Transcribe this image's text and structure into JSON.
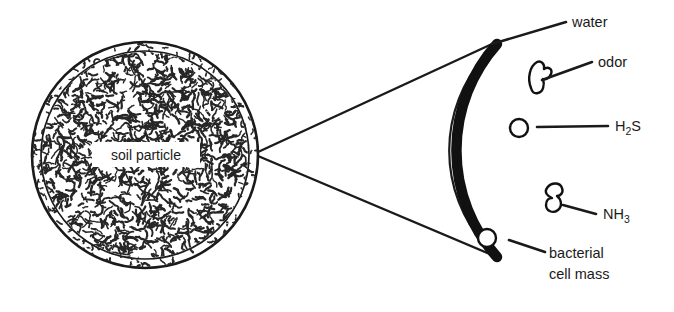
{
  "figure": {
    "background_color": "#ffffff",
    "ink_color": "#1a1a1a"
  },
  "particle": {
    "label": "soil particle",
    "shape": "circle",
    "center_x": 145,
    "center_y": 155,
    "radius": 113,
    "outer_ring_color": "#1a1a1a",
    "fill_texture": "squiggle-hatch",
    "texture_color": "#262626"
  },
  "detail": {
    "description": "magnified crescent wedge of the particle edge",
    "inner_arc_color": "#1a1a1a",
    "texture_band_color": "#262626",
    "cell_mass_band_color": "#111111"
  },
  "callouts": [
    {
      "id": "water",
      "label": "water",
      "label_x": 572,
      "label_y": 27,
      "leader_from_x": 492,
      "leader_from_y": 44,
      "leader_to_x": 566,
      "leader_to_y": 22
    },
    {
      "id": "odor",
      "label": "odor",
      "label_x": 598,
      "label_y": 67,
      "leader_from_x": 542,
      "leader_from_y": 80,
      "leader_to_x": 592,
      "leader_to_y": 62
    },
    {
      "id": "h2s",
      "label": "H",
      "label_sub": "2",
      "label_tail": "S",
      "label_x": 615,
      "label_y": 131,
      "leader_from_x": 537,
      "leader_from_y": 127,
      "leader_to_x": 608,
      "leader_to_y": 126
    },
    {
      "id": "nh3",
      "label": "NH",
      "label_sub": "3",
      "label_tail": "",
      "label_x": 603,
      "label_y": 219,
      "leader_from_x": 563,
      "leader_from_y": 205,
      "leader_to_x": 596,
      "leader_to_y": 214
    },
    {
      "id": "bacterial-cell-mass",
      "label_line1": "bacterial",
      "label_line2": "cell mass",
      "label_x": 549,
      "label_y": 258,
      "leader_from_x": 509,
      "leader_from_y": 240,
      "leader_to_x": 545,
      "leader_to_y": 252
    }
  ],
  "magnifier_lines": {
    "origin_x": 258,
    "origin_y": 152,
    "upper_to_x": 492,
    "upper_to_y": 44,
    "lower_to_x": 497,
    "lower_to_y": 257
  },
  "features": {
    "bubbles": [
      {
        "id": "bubble-upper",
        "cx": 519,
        "cy": 128,
        "r": 9
      },
      {
        "id": "bubble-lower",
        "cx": 487,
        "cy": 238,
        "r": 9
      }
    ],
    "blebs": [
      {
        "id": "bleb-odor",
        "cx": 537,
        "cy": 78
      },
      {
        "id": "bleb-nh3",
        "cx": 556,
        "cy": 202
      }
    ]
  }
}
